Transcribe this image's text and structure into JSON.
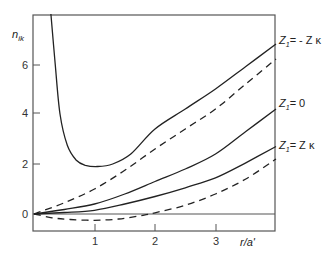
{
  "chart_data": {
    "type": "line",
    "title": "",
    "xlabel": "r/a'",
    "ylabel": "n_ik",
    "xlim": [
      0,
      4
    ],
    "ylim": [
      -0.6,
      8
    ],
    "xticks": [
      1,
      2,
      3
    ],
    "yticks": [
      0,
      2,
      4,
      6
    ],
    "xtick_labels": [
      "1",
      "2",
      "3"
    ],
    "ytick_labels": [
      "0",
      "2",
      "4",
      "6"
    ],
    "grid": false,
    "reference_line_y": 0,
    "series": [
      {
        "name": "Z1 = -Z κ (solid)",
        "style": "solid",
        "x": [
          0.28,
          0.35,
          0.43,
          0.55,
          0.7,
          0.85,
          1.05,
          1.3,
          1.6,
          2.0,
          2.5,
          3.0,
          3.5,
          4.0
        ],
        "y": [
          8.0,
          6.0,
          4.0,
          2.75,
          2.15,
          1.95,
          1.9,
          2.0,
          2.4,
          3.4,
          4.2,
          5.0,
          5.9,
          6.8
        ]
      },
      {
        "name": "Z1 = -Z κ (dashed)",
        "style": "dashed",
        "x": [
          0.0,
          0.5,
          1.0,
          1.5,
          2.0,
          2.5,
          3.0,
          3.5,
          4.0
        ],
        "y": [
          0.0,
          0.45,
          1.0,
          1.75,
          2.6,
          3.4,
          4.2,
          5.2,
          6.2
        ]
      },
      {
        "name": "Z1 = 0",
        "style": "solid",
        "x": [
          0.0,
          0.5,
          1.0,
          1.5,
          2.0,
          2.5,
          3.0,
          3.5,
          4.0
        ],
        "y": [
          0.0,
          0.18,
          0.4,
          0.8,
          1.3,
          1.8,
          2.4,
          3.3,
          4.2
        ]
      },
      {
        "name": "Z1 = Z κ (solid)",
        "style": "solid",
        "x": [
          0.0,
          0.5,
          1.0,
          1.5,
          2.0,
          2.5,
          3.0,
          3.5,
          4.0
        ],
        "y": [
          0.0,
          0.06,
          0.15,
          0.4,
          0.7,
          1.05,
          1.45,
          2.05,
          2.7
        ]
      },
      {
        "name": "Z1 = Z κ (dashed)",
        "style": "dashed",
        "x": [
          0.0,
          0.3,
          0.6,
          1.0,
          1.4,
          1.8,
          2.0,
          2.5,
          3.0,
          3.5,
          4.0
        ],
        "y": [
          0.0,
          -0.15,
          -0.22,
          -0.25,
          -0.2,
          -0.05,
          0.05,
          0.35,
          0.8,
          1.4,
          2.2
        ]
      }
    ],
    "annotations": [
      {
        "text": "Z₁ = - Z κ",
        "x": 4.0,
        "y": 6.8
      },
      {
        "text": "Z₁ = 0",
        "x": 4.0,
        "y": 4.2
      },
      {
        "text": "Z₁ = Z κ",
        "x": 4.0,
        "y": 2.7
      }
    ]
  },
  "labels": {
    "y_axis": "n",
    "y_axis_sub": "ik",
    "x_axis": "r/a'",
    "curve_top": "Z",
    "curve_top_sub": "1",
    "curve_top_rest": "= - Z κ",
    "curve_mid": "Z",
    "curve_mid_sub": "1",
    "curve_mid_rest": "= 0",
    "curve_low": "Z",
    "curve_low_sub": "1",
    "curve_low_rest": "= Z κ"
  }
}
